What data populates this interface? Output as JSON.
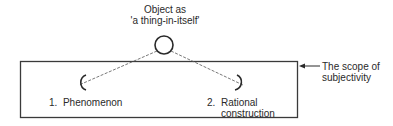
{
  "object": {
    "label_line1": "Object as",
    "label_line2": "'a thing-in-itself'"
  },
  "nodes": [
    {
      "number": "1.",
      "label_line1": "Phenomenon",
      "label_line2": ""
    },
    {
      "number": "2.",
      "label_line1": "Rational",
      "label_line2": "construction"
    }
  ],
  "scope": {
    "label_line1": "The scope of",
    "label_line2": "subjectivity"
  },
  "colors": {
    "stroke": "#3a3a3a",
    "text": "#2a2a2a",
    "background": "#ffffff"
  }
}
